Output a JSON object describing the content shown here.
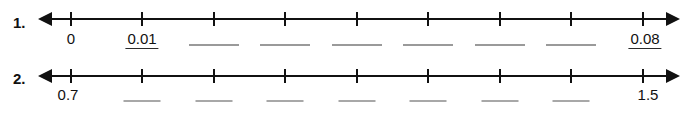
{
  "worksheet": {
    "problems": [
      {
        "number": "1.",
        "line": {
          "left_arrow_icon": "arrow-left-icon",
          "right_arrow_icon": "arrow-right-icon",
          "tick_count": 9
        },
        "slots": [
          {
            "text": "0",
            "state": "given"
          },
          {
            "text": "0.01",
            "state": "filled"
          },
          {
            "text": "",
            "state": "blank"
          },
          {
            "text": "",
            "state": "blank"
          },
          {
            "text": "",
            "state": "blank"
          },
          {
            "text": "",
            "state": "blank"
          },
          {
            "text": "",
            "state": "blank"
          },
          {
            "text": "",
            "state": "blank"
          },
          {
            "text": "0.08",
            "state": "filled"
          }
        ]
      },
      {
        "number": "2.",
        "line": {
          "left_arrow_icon": "arrow-left-icon",
          "right_arrow_icon": "arrow-right-icon",
          "tick_count": 9
        },
        "slots": [
          {
            "text": "0.7",
            "state": "given"
          },
          {
            "text": "",
            "state": "blank"
          },
          {
            "text": "",
            "state": "blank"
          },
          {
            "text": "",
            "state": "blank"
          },
          {
            "text": "",
            "state": "blank"
          },
          {
            "text": "",
            "state": "blank"
          },
          {
            "text": "",
            "state": "blank"
          },
          {
            "text": "",
            "state": "blank"
          },
          {
            "text": "1.5",
            "state": "given"
          }
        ]
      }
    ]
  }
}
